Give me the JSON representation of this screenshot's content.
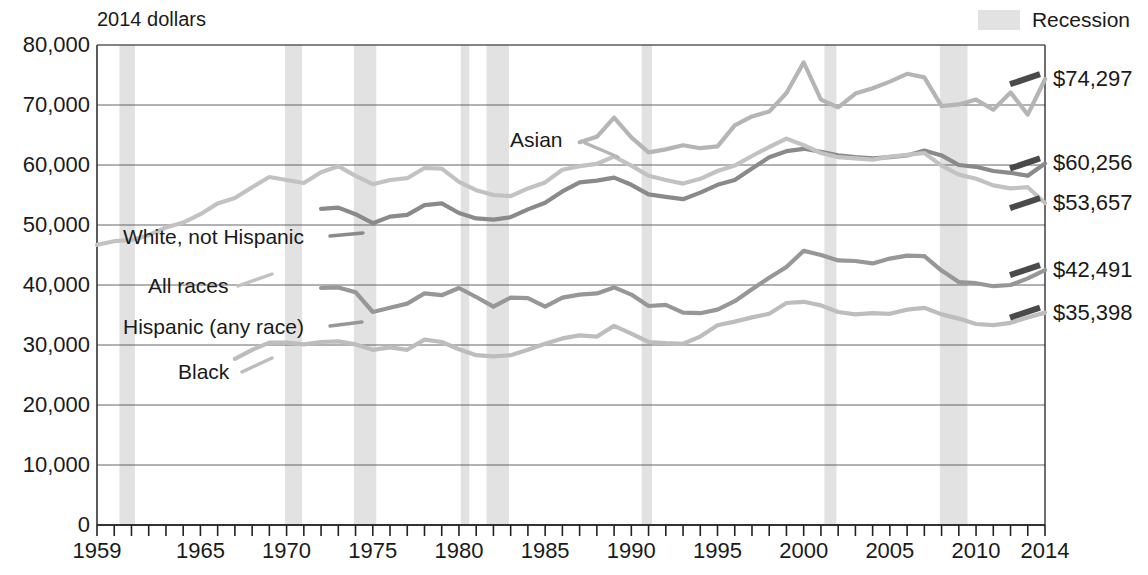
{
  "unit_note": "2014 dollars",
  "legend": {
    "recession_label": "Recession",
    "recession_color": "#e2e2e2"
  },
  "axes": {
    "y_ticks": [
      "0",
      "10,000",
      "20,000",
      "30,000",
      "40,000",
      "50,000",
      "60,000",
      "70,000",
      "80,000"
    ],
    "x_ticks": [
      "1959",
      "1965",
      "1970",
      "1975",
      "1980",
      "1985",
      "1990",
      "1995",
      "2000",
      "2005",
      "2010",
      "2014"
    ]
  },
  "series_labels": {
    "asian": "Asian",
    "white_not_hispanic": "White, not Hispanic",
    "all_races": "All races",
    "hispanic": "Hispanic (any race)",
    "black": "Black"
  },
  "end_values": {
    "asian": "$74,297",
    "white_not_hispanic": "$60,256",
    "all_races": "$53,657",
    "hispanic": "$42,491",
    "black": "$35,398"
  },
  "chart_data": {
    "type": "line",
    "title": "",
    "subtitle": "",
    "xlabel": "",
    "ylabel": "2014 dollars",
    "xlim": [
      1959,
      2014
    ],
    "ylim": [
      0,
      80000
    ],
    "grid": true,
    "legend_position": "inline-annotations",
    "x": [
      1959,
      1960,
      1961,
      1962,
      1963,
      1964,
      1965,
      1966,
      1967,
      1968,
      1969,
      1970,
      1971,
      1972,
      1973,
      1974,
      1975,
      1976,
      1977,
      1978,
      1979,
      1980,
      1981,
      1982,
      1983,
      1984,
      1985,
      1986,
      1987,
      1988,
      1989,
      1990,
      1991,
      1992,
      1993,
      1994,
      1995,
      1996,
      1997,
      1998,
      1999,
      2000,
      2001,
      2002,
      2003,
      2004,
      2005,
      2006,
      2007,
      2008,
      2009,
      2010,
      2011,
      2012,
      2013,
      2014
    ],
    "series": [
      {
        "name": "Asian",
        "color": "#b5b5b5",
        "x": [
          1987,
          1988,
          1989,
          1990,
          1991,
          1992,
          1993,
          1994,
          1995,
          1996,
          1997,
          1998,
          1999,
          2000,
          2001,
          2002,
          2003,
          2004,
          2005,
          2006,
          2007,
          2008,
          2009,
          2010,
          2011,
          2012,
          2013,
          2014
        ],
        "values": [
          63800,
          64700,
          67900,
          64600,
          62100,
          62600,
          63300,
          62800,
          63100,
          66600,
          68100,
          68900,
          72000,
          77100,
          70900,
          69600,
          71900,
          72800,
          73900,
          75200,
          74600,
          69800,
          70100,
          70900,
          69200,
          72100,
          68400,
          74297
        ],
        "end_value": 74297
      },
      {
        "name": "White, not Hispanic",
        "color": "#8a8a8a",
        "x": [
          1972,
          1973,
          1974,
          1975,
          1976,
          1977,
          1978,
          1979,
          1980,
          1981,
          1982,
          1983,
          1984,
          1985,
          1986,
          1987,
          1988,
          1989,
          1990,
          1991,
          1992,
          1993,
          1994,
          1995,
          1996,
          1997,
          1998,
          1999,
          2000,
          2001,
          2002,
          2003,
          2004,
          2005,
          2006,
          2007,
          2008,
          2009,
          2010,
          2011,
          2012,
          2013,
          2014
        ],
        "values": [
          52700,
          52900,
          51800,
          50300,
          51400,
          51700,
          53300,
          53600,
          52000,
          51100,
          50900,
          51300,
          52600,
          53700,
          55600,
          57100,
          57400,
          57900,
          56700,
          55100,
          54700,
          54300,
          55400,
          56700,
          57500,
          59400,
          61300,
          62300,
          62700,
          62200,
          61600,
          61300,
          61100,
          61300,
          61600,
          62400,
          61600,
          60000,
          59700,
          59000,
          58700,
          58200,
          60256
        ],
        "end_value": 60256
      },
      {
        "name": "All races",
        "color": "#c2c2c2",
        "x": [
          1959,
          1960,
          1961,
          1962,
          1963,
          1964,
          1965,
          1966,
          1967,
          1968,
          1969,
          1970,
          1971,
          1972,
          1973,
          1974,
          1975,
          1976,
          1977,
          1978,
          1979,
          1980,
          1981,
          1982,
          1983,
          1984,
          1985,
          1986,
          1987,
          1988,
          1989,
          1990,
          1991,
          1992,
          1993,
          1994,
          1995,
          1996,
          1997,
          1998,
          1999,
          2000,
          2001,
          2002,
          2003,
          2004,
          2005,
          2006,
          2007,
          2008,
          2009,
          2010,
          2011,
          2012,
          2013,
          2014
        ],
        "values": [
          46700,
          47300,
          47500,
          48300,
          49600,
          50400,
          51800,
          53600,
          54500,
          56300,
          58000,
          57500,
          57000,
          58800,
          59800,
          58200,
          56800,
          57500,
          57800,
          59500,
          59400,
          57200,
          55800,
          55000,
          54800,
          56100,
          57100,
          59200,
          59800,
          60200,
          61400,
          59900,
          58200,
          57500,
          56900,
          57700,
          59000,
          59900,
          61500,
          63000,
          64400,
          63300,
          62000,
          61300,
          61100,
          60900,
          61400,
          61700,
          62000,
          59900,
          58400,
          57700,
          56600,
          56100,
          56300,
          53657
        ],
        "end_value": 53657
      },
      {
        "name": "Hispanic (any race)",
        "color": "#979797",
        "x": [
          1972,
          1973,
          1974,
          1975,
          1976,
          1977,
          1978,
          1979,
          1980,
          1981,
          1982,
          1983,
          1984,
          1985,
          1986,
          1987,
          1988,
          1989,
          1990,
          1991,
          1992,
          1993,
          1994,
          1995,
          1996,
          1997,
          1998,
          1999,
          2000,
          2001,
          2002,
          2003,
          2004,
          2005,
          2006,
          2007,
          2008,
          2009,
          2010,
          2011,
          2012,
          2013,
          2014
        ],
        "values": [
          39500,
          39600,
          38800,
          35500,
          36200,
          36900,
          38600,
          38300,
          39500,
          38000,
          36400,
          37900,
          37800,
          36400,
          37900,
          38400,
          38600,
          39600,
          38400,
          36500,
          36700,
          35400,
          35300,
          35900,
          37300,
          39300,
          41200,
          43000,
          45700,
          45000,
          44100,
          44000,
          43600,
          44400,
          44900,
          44800,
          42400,
          40500,
          40300,
          39800,
          40000,
          41100,
          42491
        ],
        "end_value": 42491
      },
      {
        "name": "Black",
        "color": "#bdbdbd",
        "x": [
          1967,
          1968,
          1969,
          1970,
          1971,
          1972,
          1973,
          1974,
          1975,
          1976,
          1977,
          1978,
          1979,
          1980,
          1981,
          1982,
          1983,
          1984,
          1985,
          1986,
          1987,
          1988,
          1989,
          1990,
          1991,
          1992,
          1993,
          1994,
          1995,
          1996,
          1997,
          1998,
          1999,
          2000,
          2001,
          2002,
          2003,
          2004,
          2005,
          2006,
          2007,
          2008,
          2009,
          2010,
          2011,
          2012,
          2013,
          2014
        ],
        "values": [
          27700,
          29200,
          30400,
          30400,
          30100,
          30500,
          30600,
          30100,
          29200,
          29600,
          29200,
          30900,
          30500,
          29300,
          28300,
          28100,
          28300,
          29200,
          30200,
          31100,
          31600,
          31400,
          33200,
          31900,
          30500,
          30300,
          30200,
          31400,
          33300,
          33900,
          34600,
          35200,
          37000,
          37200,
          36600,
          35500,
          35100,
          35300,
          35200,
          35900,
          36200,
          35100,
          34400,
          33500,
          33300,
          33700,
          34600,
          35398
        ],
        "end_value": 35398
      }
    ],
    "recessions": [
      {
        "start": 1960.3,
        "end": 1961.2
      },
      {
        "start": 1969.9,
        "end": 1970.9
      },
      {
        "start": 1973.9,
        "end": 1975.2
      },
      {
        "start": 1980.1,
        "end": 1980.6
      },
      {
        "start": 1981.6,
        "end": 1982.9
      },
      {
        "start": 1990.6,
        "end": 1991.2
      },
      {
        "start": 2001.2,
        "end": 2001.9
      },
      {
        "start": 2007.9,
        "end": 2009.5
      }
    ]
  }
}
